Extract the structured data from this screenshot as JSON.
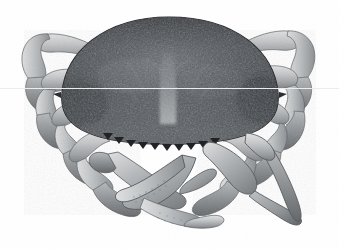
{
  "image": {
    "subject": "crab",
    "common_name": "Dungeness crab",
    "view": "dorsal",
    "medium": "grayscale photograph",
    "background_color": "#ffffff",
    "width": 339,
    "height": 249,
    "caption": "",
    "alt_text": "Grayscale dorsal view photograph of a crab with a wide dark mottled carapace, two front claws folded beneath, and four pairs of pale walking legs spread to each side on a plain white background."
  },
  "palette": {
    "background": "#ffffff",
    "carapace_darkest": "#2f3133",
    "carapace_dark": "#41454a",
    "carapace_mid": "#5d6268",
    "carapace_light": "#848a90",
    "carapace_highlight": "#a9aeb2",
    "limb_light": "#c9cbcc",
    "limb_mid": "#a3a6a8",
    "limb_dark": "#75797c",
    "limb_outline": "#4d5053",
    "seam_line": "#ececec"
  },
  "anatomy": {
    "parts": [
      {
        "name": "carapace",
        "label": "Carapace",
        "count": 1
      },
      {
        "name": "front-margin-teeth",
        "label": "Anterolateral teeth",
        "count": 10
      },
      {
        "name": "left-cheliped",
        "label": "Left cheliped (claw)",
        "count": 1
      },
      {
        "name": "right-cheliped",
        "label": "Right cheliped (claw)",
        "count": 1
      },
      {
        "name": "walking-legs",
        "label": "Walking legs",
        "count": 8
      }
    ]
  },
  "markings": {
    "carapace_texture": "granular mottled speckling",
    "median_groove": "pale vertical groove at carapace midline",
    "leg_banding": "faint transverse bands on merus and carpus segments"
  }
}
